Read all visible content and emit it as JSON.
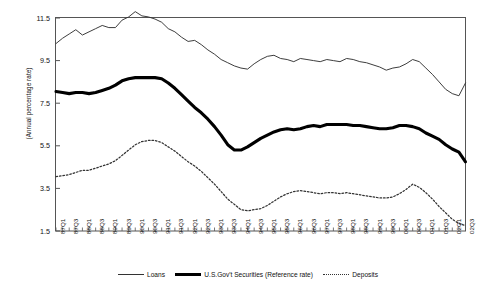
{
  "chart_data": {
    "type": "line",
    "title": "",
    "xlabel": "",
    "ylabel": "(Annual percentage rate)",
    "ylim": [
      1.5,
      11.5
    ],
    "yticks": [
      1.5,
      3.5,
      5.5,
      7.5,
      9.5,
      11.5
    ],
    "grid": false,
    "legend_position": "bottom",
    "categories": [
      "87Q1",
      "87Q2",
      "87Q3",
      "87Q4",
      "88Q1",
      "88Q2",
      "88Q3",
      "88Q4",
      "89Q1",
      "89Q2",
      "89Q3",
      "89Q4",
      "90Q1",
      "90Q2",
      "90Q3",
      "90Q4",
      "91Q1",
      "91Q2",
      "91Q3",
      "91Q4",
      "92Q1",
      "92Q2",
      "92Q3",
      "92Q4",
      "93Q1",
      "93Q2",
      "93Q3",
      "93Q4",
      "94Q1",
      "94Q2",
      "94Q3",
      "94Q4",
      "95Q1",
      "95Q2",
      "95Q3",
      "95Q4",
      "96Q1",
      "96Q2",
      "96Q3",
      "96Q4",
      "97Q1",
      "97Q2",
      "97Q3",
      "97Q4",
      "98Q1",
      "98Q2",
      "98Q3",
      "98Q4",
      "99Q1",
      "99Q2",
      "99Q3",
      "99Q4",
      "00Q1",
      "00Q2",
      "00Q3",
      "00Q4",
      "01Q1",
      "01Q2",
      "01Q3",
      "01Q4",
      "02Q1",
      "02Q2",
      "02Q3"
    ],
    "xtick_labels": [
      "87Q1",
      "87Q3",
      "88Q1",
      "88Q3",
      "89Q1",
      "89Q3",
      "90Q1",
      "90Q3",
      "91Q1",
      "91Q3",
      "92Q1",
      "92Q3",
      "93Q1",
      "93Q3",
      "94Q1",
      "94Q3",
      "95Q1",
      "95Q3",
      "96Q1",
      "96Q3",
      "97Q1",
      "97Q3",
      "98Q1",
      "98Q3",
      "99Q1",
      "99Q3",
      "00Q1",
      "00Q3",
      "01Q1",
      "01Q3",
      "02Q1",
      "02Q3"
    ],
    "series": [
      {
        "name": "Loans",
        "style": "thin-solid",
        "color": "#333333",
        "values": [
          10.3,
          10.55,
          10.75,
          10.95,
          10.7,
          10.85,
          11.0,
          11.15,
          11.05,
          11.05,
          11.4,
          11.55,
          11.8,
          11.6,
          11.55,
          11.45,
          11.3,
          11.0,
          10.85,
          10.6,
          10.4,
          10.45,
          10.25,
          10.0,
          9.8,
          9.55,
          9.4,
          9.25,
          9.15,
          9.1,
          9.35,
          9.55,
          9.7,
          9.75,
          9.6,
          9.55,
          9.45,
          9.6,
          9.55,
          9.5,
          9.45,
          9.55,
          9.5,
          9.45,
          9.6,
          9.55,
          9.45,
          9.4,
          9.3,
          9.2,
          9.05,
          9.15,
          9.2,
          9.35,
          9.55,
          9.45,
          9.15,
          8.85,
          8.5,
          8.15,
          7.95,
          7.85,
          8.45
        ]
      },
      {
        "name": "U.S.Gov't Securities (Reference rate)",
        "style": "thick-solid",
        "color": "#000000",
        "values": [
          8.05,
          8.0,
          7.95,
          8.0,
          8.0,
          7.95,
          8.0,
          8.1,
          8.2,
          8.35,
          8.55,
          8.65,
          8.7,
          8.7,
          8.7,
          8.7,
          8.65,
          8.45,
          8.2,
          7.9,
          7.6,
          7.3,
          7.05,
          6.75,
          6.4,
          6.0,
          5.55,
          5.3,
          5.3,
          5.45,
          5.65,
          5.85,
          6.0,
          6.15,
          6.25,
          6.3,
          6.25,
          6.3,
          6.4,
          6.45,
          6.4,
          6.5,
          6.5,
          6.5,
          6.5,
          6.45,
          6.45,
          6.4,
          6.35,
          6.3,
          6.3,
          6.35,
          6.45,
          6.45,
          6.4,
          6.3,
          6.1,
          5.95,
          5.8,
          5.55,
          5.35,
          5.2,
          4.75
        ]
      },
      {
        "name": "Deposits",
        "style": "dotted",
        "color": "#333333",
        "values": [
          4.05,
          4.1,
          4.15,
          4.25,
          4.35,
          4.35,
          4.45,
          4.55,
          4.65,
          4.8,
          5.05,
          5.3,
          5.55,
          5.7,
          5.75,
          5.75,
          5.65,
          5.45,
          5.25,
          5.0,
          4.75,
          4.55,
          4.3,
          4.0,
          3.7,
          3.35,
          3.0,
          2.75,
          2.5,
          2.45,
          2.5,
          2.55,
          2.7,
          2.9,
          3.1,
          3.25,
          3.35,
          3.4,
          3.35,
          3.3,
          3.25,
          3.3,
          3.3,
          3.25,
          3.3,
          3.25,
          3.2,
          3.15,
          3.1,
          3.05,
          3.05,
          3.1,
          3.25,
          3.45,
          3.7,
          3.55,
          3.3,
          3.0,
          2.65,
          2.35,
          2.05,
          1.85,
          1.75
        ]
      }
    ]
  },
  "legend": {
    "items": [
      {
        "label": "Loans"
      },
      {
        "label": "U.S.Gov't Securities (Reference rate)"
      },
      {
        "label": "Deposits"
      }
    ]
  }
}
